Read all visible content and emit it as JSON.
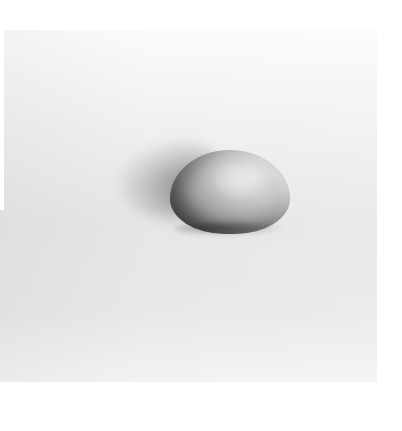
{
  "image": {
    "subject": "dome-shaped object on a light surface",
    "colors": {
      "background": "#ffffff",
      "surface_light": "#f1f1f1",
      "surface_mid": "#e6e6e6",
      "object_light": "#e4e4e4",
      "object_dark": "#3a3a3a"
    }
  }
}
